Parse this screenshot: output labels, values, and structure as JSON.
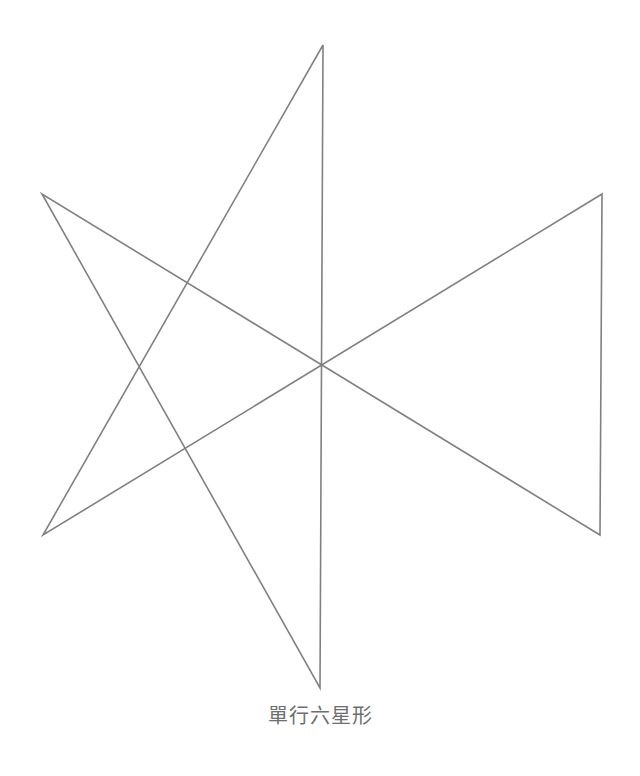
{
  "figure": {
    "caption": "單行六星形",
    "caption_color": "#6e6e6e",
    "background_color": "#ffffff",
    "stroke_color": "#808080",
    "stroke_width": 1.6,
    "canvas": {
      "width": 640,
      "height": 776
    }
  },
  "chart_data": {
    "type": "line",
    "title": "單行六星形",
    "xlabel": "",
    "ylabel": "",
    "xlim": [
      0,
      640
    ],
    "ylim": [
      0,
      776
    ],
    "grid": false,
    "legend": "none",
    "vertices": [
      {
        "name": "top",
        "x": 323,
        "y": 45
      },
      {
        "name": "upper-left",
        "x": 42,
        "y": 194
      },
      {
        "name": "upper-right",
        "x": 602,
        "y": 194
      },
      {
        "name": "lower-left",
        "x": 43,
        "y": 535
      },
      {
        "name": "lower-right",
        "x": 600,
        "y": 535
      },
      {
        "name": "bottom",
        "x": 320,
        "y": 688
      }
    ],
    "path_order": [
      "top",
      "lower-left",
      "upper-right",
      "lower-right",
      "upper-left",
      "bottom",
      "top"
    ],
    "path_points": [
      [
        323,
        45
      ],
      [
        43,
        535
      ],
      [
        602,
        194
      ],
      [
        600,
        535
      ],
      [
        42,
        194
      ],
      [
        320,
        688
      ],
      [
        323,
        45
      ]
    ],
    "crossings": [
      {
        "x": 186,
        "y": 285
      },
      {
        "x": 458,
        "y": 285
      },
      {
        "x": 138,
        "y": 372
      },
      {
        "x": 322,
        "y": 370
      },
      {
        "x": 505,
        "y": 372
      },
      {
        "x": 185,
        "y": 452
      },
      {
        "x": 457,
        "y": 452
      }
    ]
  }
}
